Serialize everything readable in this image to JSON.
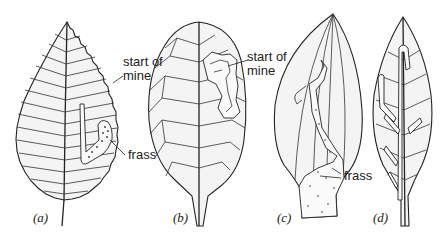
{
  "figure": {
    "panels": [
      {
        "id": "a",
        "label": "(a)",
        "annotations": [
          "start of\nmine",
          "frass"
        ]
      },
      {
        "id": "b",
        "label": "(b)",
        "annotations": [
          "start of\nmine"
        ]
      },
      {
        "id": "c",
        "label": "(c)",
        "annotations": [
          "frass"
        ]
      },
      {
        "id": "d",
        "label": "(d)",
        "annotations": []
      }
    ],
    "labels": {
      "a_start_line1": "start of",
      "a_start_line2": "mine",
      "a_frass": "frass",
      "b_start_line1": "start of",
      "b_start_line2": "mine",
      "c_frass": "frass",
      "panel_a": "(a)",
      "panel_b": "(b)",
      "panel_c": "(c)",
      "panel_d": "(d)"
    }
  }
}
